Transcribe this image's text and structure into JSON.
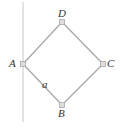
{
  "diagram": {
    "type": "square-rotated-with-vertical-line",
    "colors": {
      "line": "#aaaaaa",
      "vertical": "#c8c8c8",
      "node": "#bbbbbb",
      "text": "#333333"
    },
    "vertices": [
      {
        "id": "A",
        "label": "A",
        "x": 23,
        "y": 64
      },
      {
        "id": "B",
        "label": "B",
        "x": 62,
        "y": 105
      },
      {
        "id": "C",
        "label": "C",
        "x": 103,
        "y": 64
      },
      {
        "id": "D",
        "label": "D",
        "x": 62,
        "y": 22
      }
    ],
    "edge_label": {
      "text": "a",
      "edge": "A-B"
    }
  }
}
